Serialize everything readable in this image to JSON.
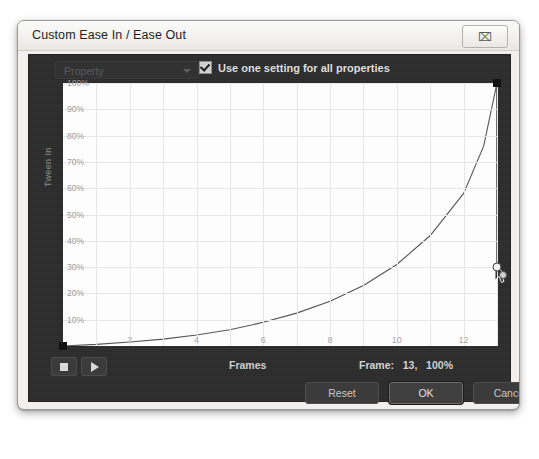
{
  "window": {
    "title": "Custom Ease In / Ease Out",
    "close_icon": "close-icon",
    "close_glyph": "⌧"
  },
  "controls": {
    "property_value": "Property",
    "property_caret_icon": "chevron-down-icon",
    "all_properties_label": "Use one setting for all properties",
    "all_properties_checked": true
  },
  "graph": {
    "y_axis_label": "Tween In",
    "x_axis_label": "Frames"
  },
  "transport": {
    "stop_icon": "stop-icon",
    "play_icon": "play-icon",
    "frames_label": "Frames",
    "frame_readout": "Frame:   13,   100%"
  },
  "buttons": {
    "reset": "Reset",
    "ok": "OK",
    "cancel": "Cancel"
  },
  "colors": {
    "dialog_bg": "#f1f0ee",
    "panel_dark": "#2c2c2c",
    "plot_bg": "#fdfdfd",
    "grid": "#e6e6e6",
    "curve": "#555555",
    "control_point": "#111111",
    "label_text": "#9b9b9b"
  },
  "chart_data": {
    "type": "line",
    "title": "",
    "xlabel": "Frames",
    "ylabel": "Tween In",
    "xlim": [
      0,
      13
    ],
    "ylim": [
      0,
      100
    ],
    "xticks": [
      2,
      4,
      6,
      8,
      10,
      12
    ],
    "yticks": [
      10,
      20,
      30,
      40,
      50,
      60,
      70,
      80,
      90,
      100
    ],
    "ytick_labels": [
      "10%",
      "20%",
      "30%",
      "40%",
      "50%",
      "60%",
      "70%",
      "80%",
      "90%",
      "100%"
    ],
    "grid": true,
    "legend": null,
    "series": [
      {
        "name": "Custom ease curve",
        "x": [
          0,
          1,
          2,
          3,
          4,
          5,
          6,
          7,
          8,
          9,
          10,
          11,
          12,
          12.6,
          13
        ],
        "y": [
          0,
          0.6,
          1.5,
          2.6,
          4.2,
          6.2,
          9.0,
          12.5,
          17.0,
          23.0,
          31.0,
          42.0,
          58.0,
          76.0,
          100.0
        ]
      }
    ],
    "control_points": [
      {
        "name": "start-point",
        "x": 0,
        "y": 0
      },
      {
        "name": "end-point",
        "x": 13,
        "y": 100
      }
    ],
    "tangent_handles": [
      {
        "name": "end-tangent-handle",
        "x": 13,
        "y": 30
      },
      {
        "name": "end-tangent-handle-outer",
        "x": 13.2,
        "y": 27
      }
    ]
  }
}
